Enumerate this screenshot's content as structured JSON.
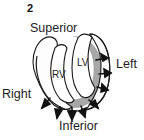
{
  "figure": {
    "number": "2",
    "type": "anatomical-diagram",
    "background_color": "#ffffff"
  },
  "orientation_labels": {
    "superior": "Superior",
    "inferior": "Inferior",
    "left": "Left",
    "right": "Right"
  },
  "chamber_labels": {
    "lv": "LV",
    "rv": "RV"
  },
  "colors": {
    "myocardium_fill": "#a7a7a7",
    "cavity_fill": "#ffffff",
    "outline": "#1a1a1a",
    "arrow": "#111111",
    "text": "#1c1c1c",
    "figure_number": "#111111"
  },
  "arrows": {
    "count": 8,
    "description": "outward-pointing arrows around left and inferior myocardial border",
    "items": [
      {
        "name": "arrow-left-upper",
        "direction": "right"
      },
      {
        "name": "arrow-left-middle",
        "direction": "right"
      },
      {
        "name": "arrow-left-lower",
        "direction": "down-right"
      },
      {
        "name": "arrow-inferior-right",
        "direction": "down-right"
      },
      {
        "name": "arrow-inferior-center-right",
        "direction": "down"
      },
      {
        "name": "arrow-inferior-center",
        "direction": "down"
      },
      {
        "name": "arrow-inferior-center-left",
        "direction": "down"
      },
      {
        "name": "arrow-inferior-left",
        "direction": "down-left"
      }
    ]
  }
}
